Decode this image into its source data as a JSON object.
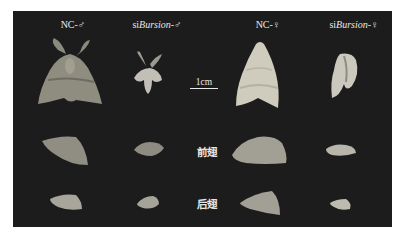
{
  "figure": {
    "background_color": "#1c1c1c",
    "column_headers": [
      {
        "prefix": "NC-",
        "italic": "",
        "suffix": "♂"
      },
      {
        "prefix": "si",
        "italic": "Bursion",
        "suffix": "-♂"
      },
      {
        "prefix": "NC-",
        "italic": "",
        "suffix": "♀"
      },
      {
        "prefix": "si",
        "italic": "Bursion",
        "suffix": "-♀"
      }
    ],
    "scale_bar": {
      "label": "1cm"
    },
    "row_labels": {
      "forewing": "前翅",
      "hindwing": "后翅"
    },
    "specimens": {
      "whole_body": [
        "NC male moth",
        "siBursion male moth (deformed wings)",
        "NC female moth",
        "siBursion female moth (deformed wings)"
      ],
      "forewings": [
        "NC male forewing",
        "siBursion male forewing",
        "NC female forewing",
        "siBursion female forewing"
      ],
      "hindwings": [
        "NC male hindwing",
        "siBursion male hindwing",
        "NC female hindwing",
        "siBursion female hindwing"
      ]
    }
  }
}
